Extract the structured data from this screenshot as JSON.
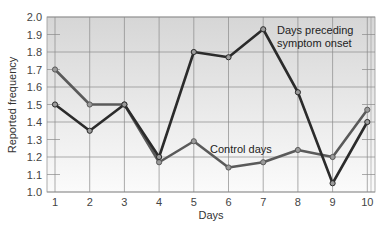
{
  "chart_data": {
    "type": "line",
    "title": "",
    "xlabel": "Days",
    "ylabel": "Reported frequency",
    "x": [
      1,
      2,
      3,
      4,
      5,
      6,
      7,
      8,
      9,
      10
    ],
    "ylim": [
      1.0,
      2.0
    ],
    "yticks": [
      "1.0",
      "1.1",
      "1.2",
      "1.3",
      "1.4",
      "1.5",
      "1.6",
      "1.7",
      "1.8",
      "1.9",
      "2.0"
    ],
    "xticks": [
      "1",
      "2",
      "3",
      "4",
      "5",
      "6",
      "7",
      "8",
      "9",
      "10"
    ],
    "grid": true,
    "legend": "inline annotations",
    "series": [
      {
        "name": "Days preceding symptom onset",
        "color": "#2b2b2b",
        "values": [
          1.5,
          1.35,
          1.5,
          1.2,
          1.8,
          1.77,
          1.93,
          1.57,
          1.05,
          1.4
        ]
      },
      {
        "name": "Control days",
        "color": "#5a5a5a",
        "values": [
          1.7,
          1.5,
          1.5,
          1.17,
          1.29,
          1.14,
          1.17,
          1.24,
          1.2,
          1.47
        ]
      }
    ],
    "annotations": [
      {
        "text_line1": "Days preceding",
        "text_line2": "symptom onset",
        "series": 0
      },
      {
        "text": "Control days",
        "series": 1
      }
    ]
  },
  "labels": {
    "xlabel": "Days",
    "ylabel": "Reported frequency",
    "annot_preceding_1": "Days preceding",
    "annot_preceding_2": "symptom onset",
    "annot_control": "Control days"
  },
  "colors": {
    "bg_top": "#d6d6d6",
    "bg_bottom": "#fbfbfb",
    "grid": "#8a8a8a",
    "marker_fill": "#9a9a9a"
  }
}
